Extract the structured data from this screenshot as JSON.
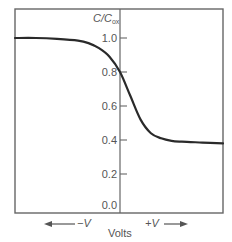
{
  "chart_data": {
    "type": "line",
    "title": "",
    "xlabel": "Volts",
    "ylabel": "C/C_ox",
    "ylabel_main": "C/C",
    "ylabel_sub": "ox",
    "ylim": [
      0.0,
      1.05
    ],
    "yticks": [
      "0.0",
      "0.2",
      "0.4",
      "0.6",
      "0.8",
      "1.0"
    ],
    "ytick_values": [
      0.0,
      0.2,
      0.4,
      0.6,
      0.8,
      1.0
    ],
    "grid": false,
    "legend": null,
    "direction_labels": {
      "negative": "−V",
      "positive": "+V"
    },
    "series": [
      {
        "name": "C/Cox vs gate voltage",
        "x": [
          -1.0,
          -0.8,
          -0.6,
          -0.4,
          -0.3,
          -0.2,
          -0.1,
          0.0,
          0.1,
          0.2,
          0.3,
          0.4,
          0.5,
          0.6,
          0.8,
          1.0
        ],
        "values": [
          1.0,
          1.0,
          0.995,
          0.985,
          0.97,
          0.94,
          0.89,
          0.8,
          0.66,
          0.52,
          0.44,
          0.41,
          0.395,
          0.39,
          0.385,
          0.38
        ]
      }
    ]
  }
}
